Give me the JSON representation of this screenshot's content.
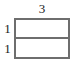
{
  "figure": {
    "kind": "labelled-rectangle-diagram",
    "colors": {
      "stroke": "#6e6e6e",
      "fill": "#ffffff",
      "text": "#1a1a1a",
      "background": "#ffffff"
    },
    "labels": {
      "top_width": "3",
      "left_upper_height": "1",
      "left_lower_height": "1"
    }
  },
  "chart_data": {
    "type": "diagram",
    "title": "",
    "shape": "rectangle",
    "width": 3,
    "height": 2,
    "subdivisions": [
      {
        "label": "1",
        "width": 3,
        "height": 1
      },
      {
        "label": "1",
        "width": 3,
        "height": 1
      }
    ],
    "annotations": [
      {
        "text": "3",
        "position": "top",
        "meaning": "rectangle width"
      },
      {
        "text": "1",
        "position": "left-upper",
        "meaning": "upper strip height"
      },
      {
        "text": "1",
        "position": "left-lower",
        "meaning": "lower strip height"
      }
    ],
    "grid": false,
    "legend": null
  }
}
